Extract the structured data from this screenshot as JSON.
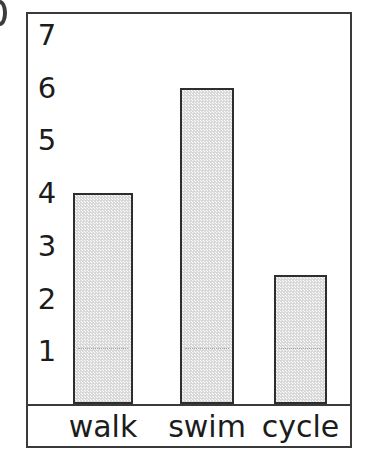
{
  "figure": {
    "artifact_label": "",
    "frame_color": "#3a3a3a",
    "background_color": "#ffffff"
  },
  "chart_data": {
    "type": "bar",
    "title": "",
    "subtitle": "",
    "xlabel": "",
    "ylabel": "",
    "categories": [
      "walk",
      "swim",
      "cycle"
    ],
    "values": [
      4,
      6,
      2.45
    ],
    "series": [
      {
        "name": "",
        "values": [
          4,
          6,
          2.45
        ]
      }
    ],
    "ylim": [
      0,
      7.4
    ],
    "xlim": [
      0,
      3
    ],
    "y_ticks": [
      1,
      2,
      3,
      4,
      5,
      6,
      7
    ],
    "y_tick_labels": [
      "1",
      "2",
      "3",
      "4",
      "5",
      "6",
      "7"
    ],
    "x_tick_labels": [
      "walk",
      "swim",
      "cycle"
    ],
    "grid": false,
    "gridlines_visible_at": [
      1
    ],
    "gridline_style": "dotted",
    "legend": null,
    "legend_position": "none",
    "bar_fill_color": "#d9d9d9",
    "bar_edge_color": "#2e2e2e",
    "annotations": []
  }
}
